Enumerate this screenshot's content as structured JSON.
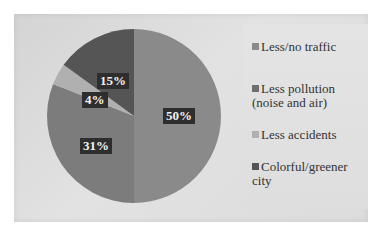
{
  "chart_data": {
    "type": "pie",
    "title": "",
    "categories": [
      "Less/no traffic",
      "Less pollution (noise and air)",
      "Less accidents",
      "Colorful/greener city"
    ],
    "values": [
      50,
      31,
      4,
      15
    ],
    "labels": [
      "50%",
      "31%",
      "4%",
      "15%"
    ],
    "colors": [
      "#8a8a8a",
      "#7c7c7c",
      "#b0b0b0",
      "#555555"
    ],
    "legend_position": "right",
    "start_angle_deg": 0,
    "direction": "clockwise"
  },
  "legend": {
    "items": [
      {
        "label": "Less/no traffic",
        "color": "#8a8a8a"
      },
      {
        "label": "Less pollution (noise and air)",
        "color": "#6e6e6e"
      },
      {
        "label": "Less accidents",
        "color": "#b0b0b0"
      },
      {
        "label": "Colorful/greener city",
        "color": "#555555"
      }
    ]
  }
}
